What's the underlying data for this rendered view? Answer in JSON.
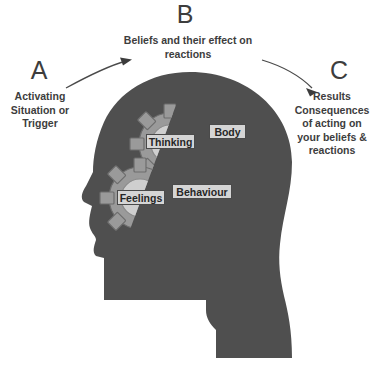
{
  "diagram": {
    "title_letters": {
      "a": "A",
      "b": "B",
      "c": "C"
    },
    "blocks": {
      "a_text": "Activating Situation or Trigger",
      "b_text": "Beliefs and their effect on reactions",
      "c_text": "Results Consequences of acting on your beliefs & reactions"
    },
    "gears": [
      {
        "label": "Thinking"
      },
      {
        "label": "Body"
      },
      {
        "label": "Feelings"
      },
      {
        "label": "Behaviour"
      }
    ],
    "arrows": [
      {
        "name": "arrow-a-to-b",
        "direction": "up-right"
      },
      {
        "name": "arrow-b-to-c",
        "direction": "down-right"
      }
    ],
    "colors": {
      "background": "#ffffff",
      "head_fill": "#4f4f4f",
      "gear_body": "#9a9a9a",
      "gear_inner": "#c9c9c9",
      "gear_outline": "#6a6a6a",
      "label_box": "#d5d5d5",
      "text": "#3d3d3d",
      "arrow": "#4a4a4a"
    }
  }
}
